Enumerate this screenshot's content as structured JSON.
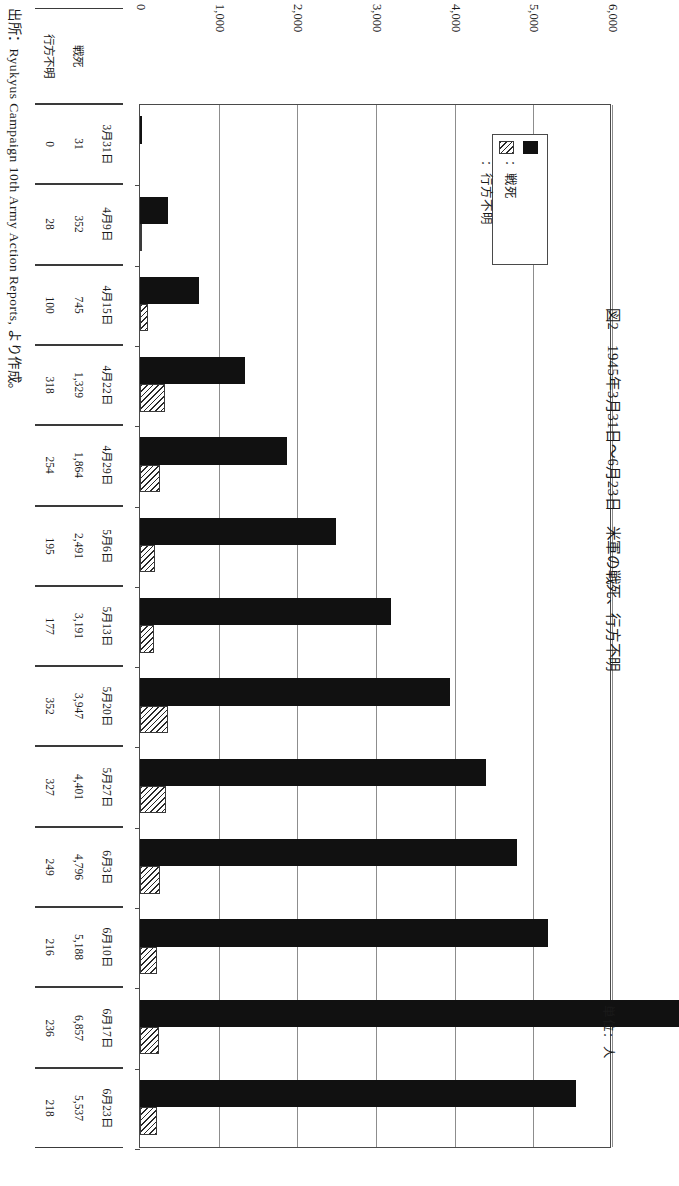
{
  "figure": {
    "title": "図2　1945年3月31日〜6月23日　米軍の戦死、行方不明",
    "unit_label": "単位：人",
    "source": "出所：Ryukyus Campaign 10th Army Action Reports, より作成。"
  },
  "legend": {
    "entries": [
      {
        "swatch": "black-solid",
        "label": "：戦死"
      },
      {
        "swatch": "hatched",
        "label": "：行方不明"
      }
    ]
  },
  "axis": {
    "ticks": [
      "0",
      "1,000",
      "2,000",
      "3,000",
      "4,000",
      "5,000",
      "6,000"
    ],
    "tick_values": [
      0,
      1000,
      2000,
      3000,
      4000,
      5000,
      6000
    ],
    "min": 0,
    "max": 6000
  },
  "table": {
    "corner_label": "",
    "row_headers": [
      "戦死",
      "行方不明"
    ],
    "date_headers": [
      "3月31日",
      "4月9日",
      "4月15日",
      "4月22日",
      "4月29日",
      "5月6日",
      "5月13日",
      "5月20日",
      "5月27日",
      "6月3日",
      "6月10日",
      "6月17日",
      "6月23日"
    ],
    "kia_cells": [
      "31",
      "352",
      "745",
      "1,329",
      "1,864",
      "2,491",
      "3,191",
      "3,947",
      "4,401",
      "4,796",
      "5,188",
      "6,857",
      "5,537"
    ],
    "mia_cells": [
      "0",
      "28",
      "100",
      "318",
      "254",
      "195",
      "177",
      "352",
      "327",
      "249",
      "216",
      "236",
      "218"
    ]
  },
  "chart_data": {
    "type": "bar",
    "orientation": "horizontal",
    "title": "図2　1945年3月31日〜6月23日　米軍の戦死、行方不明",
    "xlabel": "",
    "ylabel": "",
    "unit": "人",
    "grid": true,
    "legend_position": "inside-upper-right",
    "xlim": [
      0,
      6000
    ],
    "categories": [
      "3月31日",
      "4月9日",
      "4月15日",
      "4月22日",
      "4月29日",
      "5月6日",
      "5月13日",
      "5月20日",
      "5月27日",
      "6月3日",
      "6月10日",
      "6月17日",
      "6月23日"
    ],
    "series": [
      {
        "name": "戦死",
        "values": [
          31,
          352,
          745,
          1329,
          1864,
          2491,
          3191,
          3947,
          4401,
          4796,
          5188,
          6857,
          5537
        ]
      },
      {
        "name": "行方不明",
        "values": [
          0,
          28,
          100,
          318,
          254,
          195,
          177,
          352,
          327,
          249,
          216,
          236,
          218
        ]
      }
    ],
    "source": "出所：Ryukyus Campaign 10th Army Action Reports, より作成。"
  },
  "colors": {
    "kia": "#111111",
    "mia_hatch": "#2a2a2a",
    "grid": "#8d8d8d",
    "axis": "#4a4a4a"
  }
}
